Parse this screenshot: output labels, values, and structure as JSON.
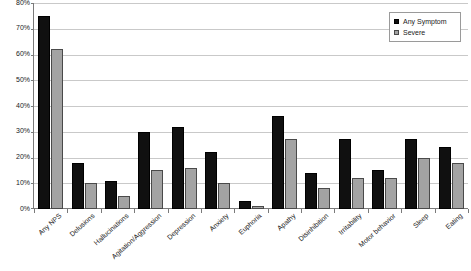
{
  "chart_data": {
    "type": "bar",
    "title": "",
    "xlabel": "",
    "ylabel": "",
    "ylim": [
      0,
      80
    ],
    "ytick_step": 10,
    "ytick_labels": [
      "0%",
      "10%",
      "20%",
      "30%",
      "40%",
      "50%",
      "60%",
      "70%",
      "80%"
    ],
    "grid": true,
    "legend_position": "top-right",
    "categories": [
      "Any NPS",
      "Delusions",
      "Hallucinations",
      "Agitation/Aggression",
      "Depression",
      "Anxiety",
      "Euphoria",
      "Apathy",
      "Disinhibition",
      "Irritability",
      "Motor behavior",
      "Sleep",
      "Eating"
    ],
    "series": [
      {
        "name": "Any Symptom",
        "color": "#101010",
        "values": [
          75,
          18,
          11,
          30,
          32,
          22,
          3,
          36,
          14,
          27,
          15,
          27,
          24
        ]
      },
      {
        "name": "Severe",
        "color": "#a3a3a3",
        "values": [
          62,
          10,
          5,
          15,
          16,
          10,
          1,
          27,
          8,
          12,
          12,
          20,
          18
        ]
      }
    ]
  },
  "legend": {
    "items": [
      {
        "label": "Any Symptom",
        "swatch": "black-square-icon"
      },
      {
        "label": "Severe",
        "swatch": "gray-square-icon"
      }
    ]
  }
}
